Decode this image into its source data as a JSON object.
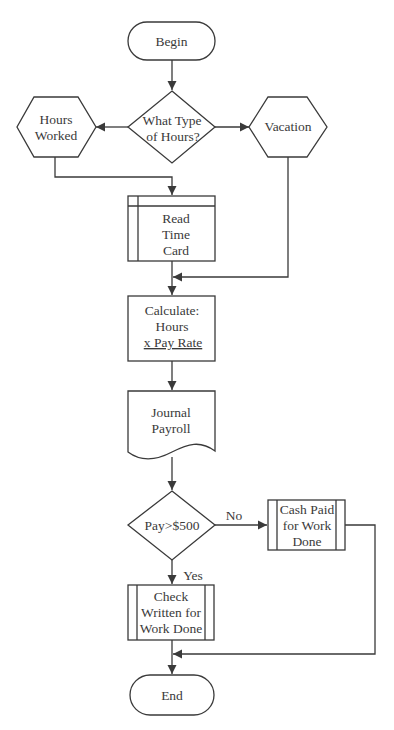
{
  "diagram": {
    "type": "flowchart",
    "colors": {
      "stroke": "#3a3a3a",
      "text": "#3a3a3a",
      "fill": "#ffffff",
      "background": "#ffffff"
    },
    "nodes": {
      "begin": {
        "shape": "terminator",
        "label": "Begin"
      },
      "hours_type": {
        "shape": "decision",
        "lines": [
          "What Type",
          "of Hours?"
        ]
      },
      "hours_worked": {
        "shape": "hexagon",
        "lines": [
          "Hours",
          "Worked"
        ]
      },
      "vacation": {
        "shape": "hexagon",
        "label": "Vacation"
      },
      "read_time_card": {
        "shape": "internal-storage",
        "lines": [
          "Read",
          "Time",
          "Card"
        ]
      },
      "calculate": {
        "shape": "process",
        "lines": [
          "Calculate:",
          "Hours",
          "x Pay Rate"
        ]
      },
      "journal_payroll": {
        "shape": "document",
        "lines": [
          "Journal",
          "Payroll"
        ]
      },
      "pay_decision": {
        "shape": "decision",
        "label": "Pay>$500"
      },
      "cash_paid": {
        "shape": "predefined-process",
        "lines": [
          "Cash Paid",
          "for Work",
          "Done"
        ]
      },
      "check_written": {
        "shape": "predefined-process",
        "lines": [
          "Check",
          "Written for",
          "Work Done"
        ]
      },
      "end": {
        "shape": "terminator",
        "label": "End"
      }
    },
    "edge_labels": {
      "no": "No",
      "yes": "Yes"
    },
    "edges": [
      {
        "from": "begin",
        "to": "hours_type"
      },
      {
        "from": "hours_type",
        "to": "hours_worked"
      },
      {
        "from": "hours_type",
        "to": "vacation"
      },
      {
        "from": "hours_worked",
        "to": "read_time_card"
      },
      {
        "from": "read_time_card",
        "to": "calculate"
      },
      {
        "from": "vacation",
        "to": "calculate"
      },
      {
        "from": "calculate",
        "to": "journal_payroll"
      },
      {
        "from": "journal_payroll",
        "to": "pay_decision"
      },
      {
        "from": "pay_decision",
        "to": "cash_paid",
        "label": "No"
      },
      {
        "from": "pay_decision",
        "to": "check_written",
        "label": "Yes"
      },
      {
        "from": "check_written",
        "to": "end"
      },
      {
        "from": "cash_paid",
        "to": "end"
      }
    ]
  }
}
